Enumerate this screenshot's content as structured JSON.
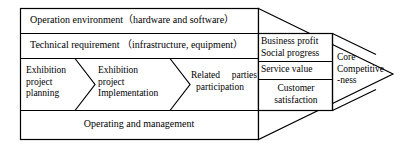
{
  "diagram": {
    "type": "arrow-process-framework",
    "layers": {
      "operation_environment": "Operation environment（hardware and software）",
      "technical_requirement": "Technical requirement （infrastructure, equipment）",
      "operating_management": "Operating and management"
    },
    "process_steps": [
      {
        "line1": "Exhibition",
        "line2": "project",
        "line3": "planning"
      },
      {
        "line1": "Exhibition",
        "line2": "project",
        "line3": "Implementation"
      },
      {
        "line1": "Related  parties",
        "line2": "participation"
      }
    ],
    "outcomes": [
      {
        "line1": "Business profit",
        "line2": "Social progress"
      },
      {
        "line1": "Service value",
        "line2": ""
      },
      {
        "line1": "Customer",
        "line2": "satisfaction"
      }
    ],
    "result": {
      "line1": "Core",
      "line2": "Competitive",
      "line3": "-ness"
    },
    "colors": {
      "stroke": "#000000",
      "fill": "#ffffff",
      "text": "#000000"
    }
  }
}
